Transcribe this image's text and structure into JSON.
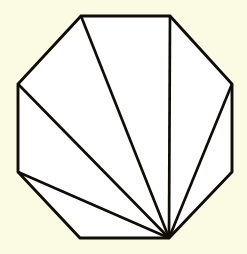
{
  "figure": {
    "name": "octagon-fan-triangulation",
    "kind": "geometric-diagram",
    "background_color": "#fbfbe3",
    "fill_color": "#ffffff",
    "stroke_color": "#100c08",
    "outline_stroke_width": 2.9,
    "diagonal_stroke_width": 2.7,
    "canvas": {
      "width": 247,
      "height": 254
    },
    "shape": {
      "type": "octagon",
      "sides": 8,
      "vertex_count": 8,
      "vertices": [
        {
          "id": "v0",
          "label": "top-left",
          "x": 81,
          "y": 16
        },
        {
          "id": "v1",
          "label": "top-right",
          "x": 170,
          "y": 16
        },
        {
          "id": "v2",
          "label": "right-upper",
          "x": 232,
          "y": 84
        },
        {
          "id": "v3",
          "label": "right-lower",
          "x": 232,
          "y": 172
        },
        {
          "id": "v4",
          "label": "bottom-right",
          "x": 169,
          "y": 238
        },
        {
          "id": "v5",
          "label": "bottom-left",
          "x": 80,
          "y": 238
        },
        {
          "id": "v6",
          "label": "left-lower",
          "x": 18,
          "y": 172
        },
        {
          "id": "v7",
          "label": "left-upper",
          "x": 18,
          "y": 84
        }
      ],
      "outline_path": "M 81,16 L 170,16 L 232,84 L 232,172 L 169,238 L 80,238 L 18,172 L 18,84 Z"
    },
    "fan": {
      "apex_vertex_id": "v4",
      "apex": {
        "x": 169,
        "y": 238
      },
      "diagonal_count": 5,
      "triangle_count": 6,
      "diagonals": [
        {
          "id": "d1",
          "from": "v4",
          "to": "v6",
          "path": "M 169,238 L 18,172"
        },
        {
          "id": "d2",
          "from": "v4",
          "to": "v7",
          "path": "M 169,238 L 18,84"
        },
        {
          "id": "d3",
          "from": "v4",
          "to": "v0",
          "path": "M 169,238 L 81,16"
        },
        {
          "id": "d4",
          "from": "v4",
          "to": "v1",
          "path": "M 169,238 L 170,16"
        },
        {
          "id": "d5",
          "from": "v4",
          "to": "v2",
          "path": "M 169,238 L 232,84"
        }
      ],
      "triangles": [
        {
          "id": "t1",
          "vertices": [
            "v4",
            "v5",
            "v6"
          ]
        },
        {
          "id": "t2",
          "vertices": [
            "v4",
            "v6",
            "v7"
          ]
        },
        {
          "id": "t3",
          "vertices": [
            "v4",
            "v7",
            "v0"
          ]
        },
        {
          "id": "t4",
          "vertices": [
            "v4",
            "v0",
            "v1"
          ]
        },
        {
          "id": "t5",
          "vertices": [
            "v4",
            "v1",
            "v2"
          ]
        },
        {
          "id": "t6",
          "vertices": [
            "v4",
            "v2",
            "v3"
          ]
        }
      ]
    }
  }
}
